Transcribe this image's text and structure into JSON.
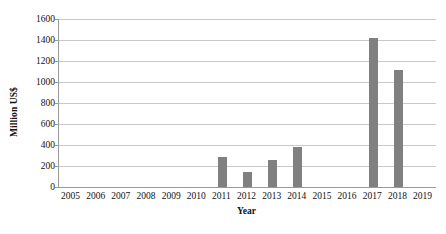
{
  "chart_data": {
    "type": "bar",
    "title": "",
    "xlabel": "Year",
    "ylabel": "Million US$",
    "categories": [
      "2005",
      "2006",
      "2007",
      "2008",
      "2009",
      "2010",
      "2011",
      "2012",
      "2013",
      "2014",
      "2015",
      "2016",
      "2017",
      "2018",
      "2019"
    ],
    "values": [
      0,
      0,
      0,
      0,
      0,
      0,
      286,
      143,
      257,
      381,
      0,
      0,
      1419,
      1114,
      0
    ],
    "ylim": [
      0,
      1600
    ],
    "ytick_labels": [
      "1600",
      "1400",
      "1200",
      "1000",
      "800",
      "600",
      "400",
      "200",
      "0"
    ],
    "ytick_values": [
      1600,
      1400,
      1200,
      1000,
      800,
      600,
      400,
      200,
      0
    ],
    "grid": true,
    "legend": "none",
    "bar_color": "#808080",
    "gridline_color": "#c9c9c9",
    "axis_color": "#9a9a9a"
  }
}
